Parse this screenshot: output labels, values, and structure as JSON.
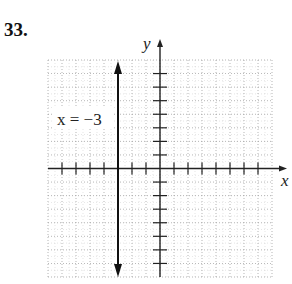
{
  "problem": {
    "number": "33."
  },
  "chart_data": {
    "type": "line",
    "title": "",
    "xlabel": "x",
    "ylabel": "y",
    "xlim": [
      -8,
      8
    ],
    "ylim": [
      -8,
      8
    ],
    "grid": true,
    "x_ticks": [
      -7,
      -6,
      -5,
      -4,
      -3,
      -2,
      -1,
      1,
      2,
      3,
      4,
      5,
      6,
      7
    ],
    "y_ticks": [
      -7,
      -6,
      -5,
      -4,
      -3,
      -2,
      -1,
      1,
      2,
      3,
      4,
      5,
      6,
      7
    ],
    "series": [
      {
        "name": "x = -3",
        "kind": "vertical-line",
        "x": -3,
        "y_range": [
          -8,
          8
        ],
        "arrows": "both"
      }
    ],
    "annotations": [
      {
        "text": "x = −3",
        "x": -5.5,
        "y": 3.5
      }
    ]
  },
  "labels": {
    "x_axis": "x",
    "y_axis": "y",
    "line_label": "x = −3"
  },
  "colors": {
    "axis": "#222222",
    "grid": "#9a9a9a",
    "line": "#111111"
  }
}
